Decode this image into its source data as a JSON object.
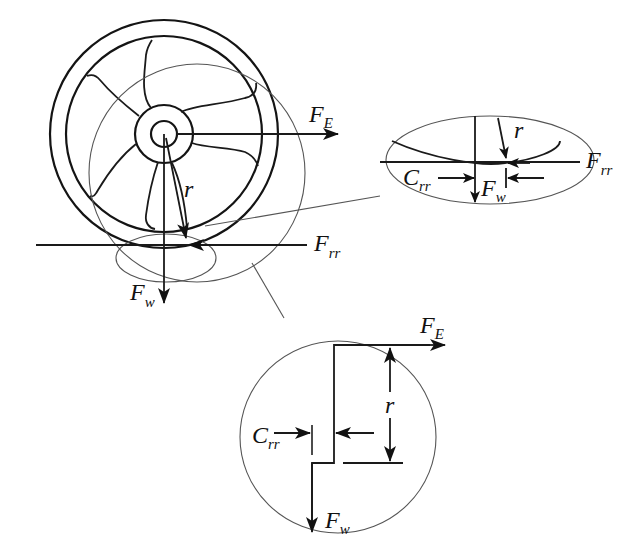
{
  "diagram": {
    "title": "",
    "labels": {
      "fe_main": "F",
      "fe_sub": "E",
      "r_main": "r",
      "frr_main": "F",
      "frr_sub": "rr",
      "fw_main": "F",
      "fw_sub": "w"
    },
    "detail_ellipse": {
      "r": "r",
      "frr_main": "F",
      "frr_sub": "rr",
      "crr_main": "C",
      "crr_sub": "rr",
      "fw_main": "F",
      "fw_sub": "w"
    },
    "detail_circle": {
      "fe_main": "F",
      "fe_sub": "E",
      "r": "r",
      "crr_main": "C",
      "crr_sub": "rr",
      "fw_main": "F",
      "fw_sub": "w"
    },
    "colors": {
      "stroke": "#141414",
      "thin_stroke": "#555555",
      "background": "#ffffff"
    }
  }
}
